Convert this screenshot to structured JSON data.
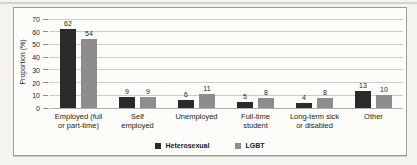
{
  "figure": {
    "page_background": "#f4f3ee",
    "frame_border_color": "#9b9b99",
    "plot_background": "#fcfcf9",
    "gridline_color": "#cbcbc7",
    "text_color": "#1c1c1c"
  },
  "chart_data": {
    "type": "bar",
    "title": "",
    "xlabel": "",
    "ylabel": "Proportion (%)",
    "ylim": [
      0,
      70
    ],
    "yticks": [
      0,
      10,
      20,
      30,
      40,
      50,
      60,
      70
    ],
    "grid": "horizontal",
    "legend_position": "bottom-center",
    "categories": [
      "Employed (full or part-time)",
      "Self employed",
      "Unemployed",
      "Full-time student",
      "Long-term sick or disabled",
      "Other"
    ],
    "category_label_lines": [
      [
        "Employed (full",
        "or part-time)"
      ],
      [
        "Self",
        "employed"
      ],
      [
        "Unemployed"
      ],
      [
        "Full-time",
        "student"
      ],
      [
        "Long-term sick",
        "or disabled"
      ],
      [
        "Other"
      ]
    ],
    "series": [
      {
        "name": "Heterosexual",
        "color": "#2a2a2a",
        "values": [
          62,
          9,
          6,
          5,
          4,
          13
        ]
      },
      {
        "name": "LGBT",
        "color": "#8d8d8d",
        "values": [
          54,
          9,
          11,
          8,
          8,
          10
        ]
      }
    ]
  }
}
